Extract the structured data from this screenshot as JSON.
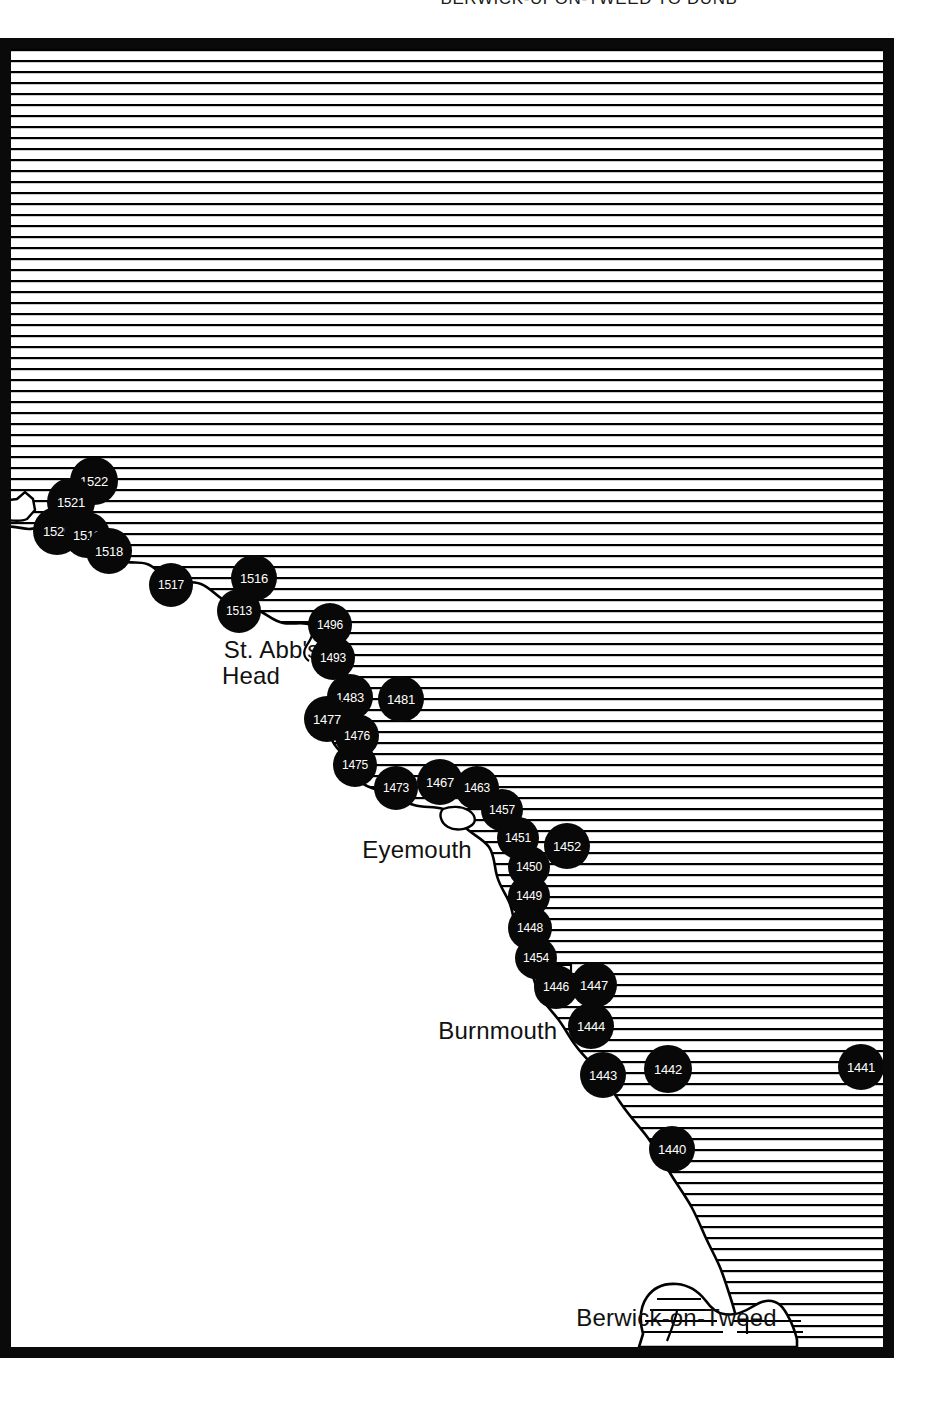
{
  "page": {
    "running_head": "BERWICK-UPON-TWEED TO DUNB",
    "width": 928,
    "height": 1410,
    "background": "#ffffff"
  },
  "map": {
    "title": "Coastal chart — Berwick-upon-Tweed to Dunbar",
    "frame_color": "#0a0a0a",
    "land_fill": "#ffffff",
    "sea_style": "horizontal-hatch-lines",
    "sea_hatch_color": "#000000",
    "sea_hatch_spacing_px": 11,
    "marker_fill": "#080808",
    "marker_text_color": "#ffffff",
    "place_labels": [
      {
        "name": "st-abbs-head",
        "text": "St. Abb's\nHead",
        "x": 240,
        "y": 572,
        "align": "center"
      },
      {
        "name": "eyemouth",
        "text": "Eyemouth",
        "x": 385,
        "y": 772,
        "align": "center"
      },
      {
        "name": "burnmouth",
        "text": "Burnmouth",
        "x": 466,
        "y": 953,
        "align": "center"
      },
      {
        "name": "berwick-on-tweed",
        "text": "Berwick-on-Tweed",
        "x": 644,
        "y": 1240,
        "align": "center"
      }
    ],
    "site_markers": [
      {
        "label": "1522",
        "x": 83,
        "y": 432,
        "r": 24
      },
      {
        "label": "1521",
        "x": 60,
        "y": 453,
        "r": 24
      },
      {
        "label": "1520",
        "x": 46,
        "y": 482,
        "r": 24
      },
      {
        "label": "1519",
        "x": 76,
        "y": 486,
        "r": 23
      },
      {
        "label": "1518",
        "x": 98,
        "y": 502,
        "r": 23
      },
      {
        "label": "1517",
        "x": 160,
        "y": 536,
        "r": 22
      },
      {
        "label": "1516",
        "x": 243,
        "y": 529,
        "r": 23
      },
      {
        "label": "1513",
        "x": 228,
        "y": 562,
        "r": 22
      },
      {
        "label": "1496",
        "x": 319,
        "y": 576,
        "r": 22
      },
      {
        "label": "1493",
        "x": 322,
        "y": 609,
        "r": 22
      },
      {
        "label": "1483",
        "x": 339,
        "y": 648,
        "r": 23
      },
      {
        "label": "1481",
        "x": 390,
        "y": 650,
        "r": 23
      },
      {
        "label": "1477",
        "x": 316,
        "y": 670,
        "r": 23
      },
      {
        "label": "1476",
        "x": 346,
        "y": 687,
        "r": 22
      },
      {
        "label": "1475",
        "x": 344,
        "y": 716,
        "r": 22
      },
      {
        "label": "1473",
        "x": 385,
        "y": 739,
        "r": 22
      },
      {
        "label": "1467",
        "x": 429,
        "y": 733,
        "r": 23
      },
      {
        "label": "1463",
        "x": 466,
        "y": 739,
        "r": 22
      },
      {
        "label": "1457",
        "x": 491,
        "y": 761,
        "r": 21
      },
      {
        "label": "1451",
        "x": 507,
        "y": 789,
        "r": 21
      },
      {
        "label": "1452",
        "x": 556,
        "y": 797,
        "r": 23
      },
      {
        "label": "1450",
        "x": 518,
        "y": 818,
        "r": 21
      },
      {
        "label": "1449",
        "x": 518,
        "y": 847,
        "r": 21
      },
      {
        "label": "1448",
        "x": 519,
        "y": 879,
        "r": 22
      },
      {
        "label": "1454",
        "x": 525,
        "y": 909,
        "r": 21
      },
      {
        "label": "1446",
        "x": 545,
        "y": 938,
        "r": 22
      },
      {
        "label": "1447",
        "x": 583,
        "y": 936,
        "r": 23
      },
      {
        "label": "1444",
        "x": 580,
        "y": 977,
        "r": 23
      },
      {
        "label": "1443",
        "x": 592,
        "y": 1026,
        "r": 23
      },
      {
        "label": "1442",
        "x": 657,
        "y": 1020,
        "r": 24
      },
      {
        "label": "1441",
        "x": 850,
        "y": 1018,
        "r": 23
      },
      {
        "label": "1440",
        "x": 661,
        "y": 1100,
        "r": 23
      }
    ]
  }
}
